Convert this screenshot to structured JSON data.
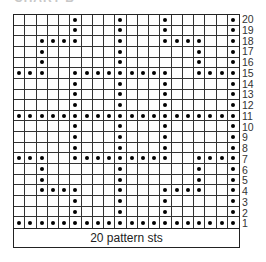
{
  "title": "CHART B",
  "footer_label": "20 pattern sts",
  "columns": 20,
  "rows": 20,
  "symbol_legend": {
    "dot": "filled-circle"
  },
  "row_numbers": [
    "20",
    "19",
    "18",
    "17",
    "16",
    "15",
    "14",
    "13",
    "12",
    "11",
    "10",
    "9",
    "8",
    "7",
    "6",
    "5",
    "4",
    "3",
    "2",
    "1"
  ],
  "dots_by_row": {
    "20": [
      6,
      10,
      14,
      20
    ],
    "19": [
      6,
      10,
      14,
      20
    ],
    "18": [
      3,
      4,
      5,
      6,
      10,
      14,
      15,
      16,
      17,
      20
    ],
    "17": [
      3,
      10,
      17,
      20
    ],
    "16": [
      3,
      10,
      17,
      20
    ],
    "15": [
      1,
      2,
      3,
      6,
      7,
      8,
      9,
      10,
      11,
      12,
      13,
      14,
      17,
      18,
      19,
      20
    ],
    "14": [
      6,
      10,
      14,
      20
    ],
    "13": [
      6,
      10,
      14,
      20
    ],
    "12": [
      6,
      10,
      14,
      20
    ],
    "11": [
      1,
      2,
      3,
      4,
      5,
      6,
      7,
      8,
      9,
      10,
      11,
      12,
      13,
      14,
      15,
      16,
      17,
      18,
      19,
      20
    ],
    "10": [
      6,
      10,
      14,
      20
    ],
    "9": [
      6,
      10,
      14,
      20
    ],
    "8": [
      6,
      10,
      14,
      20
    ],
    "7": [
      1,
      2,
      3,
      6,
      7,
      8,
      9,
      10,
      11,
      12,
      13,
      14,
      17,
      18,
      19,
      20
    ],
    "6": [
      3,
      10,
      17,
      20
    ],
    "5": [
      3,
      10,
      17,
      20
    ],
    "4": [
      3,
      4,
      5,
      6,
      10,
      14,
      15,
      16,
      17,
      20
    ],
    "3": [
      6,
      10,
      14,
      20
    ],
    "2": [
      6,
      10,
      14,
      20
    ],
    "1": [
      1,
      2,
      3,
      4,
      5,
      6,
      7,
      8,
      9,
      10,
      11,
      12,
      13,
      14,
      15,
      16,
      17,
      18,
      19,
      20
    ]
  }
}
